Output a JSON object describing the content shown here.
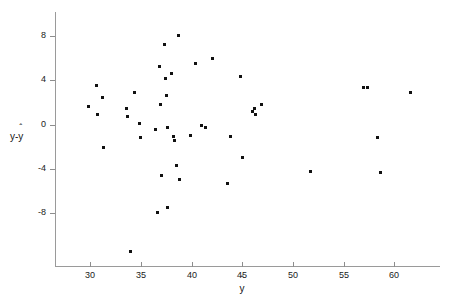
{
  "chart_data": {
    "type": "scatter",
    "title": "",
    "xlabel": "ŷ",
    "ylabel": "y-ŷ",
    "xlim": [
      26.5,
      64.5
    ],
    "ylim": [
      -12.8,
      10.2
    ],
    "grid": false,
    "legend": null,
    "xticks": [
      30,
      35,
      40,
      45,
      50,
      55,
      60
    ],
    "xticklabels": [
      "30",
      "35",
      "40",
      "45",
      "50",
      "55",
      "60"
    ],
    "yticks": [
      8,
      4,
      0,
      -4,
      -8
    ],
    "yticklabels": [
      "8",
      "4",
      "0",
      "-4",
      "-8"
    ],
    "marker": "square",
    "marker_color": "#111111",
    "axis_color": "#9a9a9a",
    "points": [
      {
        "x": 29.8,
        "y": 1.6
      },
      {
        "x": 30.6,
        "y": 3.5
      },
      {
        "x": 30.7,
        "y": 0.9
      },
      {
        "x": 31.2,
        "y": 2.5
      },
      {
        "x": 31.3,
        "y": -2.1
      },
      {
        "x": 33.6,
        "y": 1.5
      },
      {
        "x": 33.7,
        "y": 0.7
      },
      {
        "x": 34.0,
        "y": -11.5
      },
      {
        "x": 34.3,
        "y": 2.9
      },
      {
        "x": 34.8,
        "y": 0.1
      },
      {
        "x": 34.9,
        "y": -1.2
      },
      {
        "x": 36.4,
        "y": -0.4
      },
      {
        "x": 36.6,
        "y": -8.0
      },
      {
        "x": 36.8,
        "y": 5.3
      },
      {
        "x": 36.9,
        "y": 1.8
      },
      {
        "x": 37.0,
        "y": -4.6
      },
      {
        "x": 37.3,
        "y": 7.3
      },
      {
        "x": 37.4,
        "y": 4.2
      },
      {
        "x": 37.5,
        "y": 2.6
      },
      {
        "x": 37.6,
        "y": -0.3
      },
      {
        "x": 37.6,
        "y": -7.5
      },
      {
        "x": 38.0,
        "y": 4.6
      },
      {
        "x": 38.2,
        "y": -1.1
      },
      {
        "x": 38.3,
        "y": -1.4
      },
      {
        "x": 38.5,
        "y": -3.7
      },
      {
        "x": 38.7,
        "y": 8.1
      },
      {
        "x": 38.8,
        "y": -5.0
      },
      {
        "x": 39.9,
        "y": -1.0
      },
      {
        "x": 40.4,
        "y": 5.5
      },
      {
        "x": 41.0,
        "y": -0.1
      },
      {
        "x": 41.4,
        "y": -0.3
      },
      {
        "x": 42.0,
        "y": 6.0
      },
      {
        "x": 43.5,
        "y": -5.3
      },
      {
        "x": 43.8,
        "y": -1.1
      },
      {
        "x": 44.8,
        "y": 4.4
      },
      {
        "x": 45.0,
        "y": -3.0
      },
      {
        "x": 46.0,
        "y": 1.2
      },
      {
        "x": 46.2,
        "y": 1.5
      },
      {
        "x": 46.3,
        "y": 0.9
      },
      {
        "x": 46.9,
        "y": 1.8
      },
      {
        "x": 51.7,
        "y": -4.2
      },
      {
        "x": 56.9,
        "y": 3.4
      },
      {
        "x": 57.3,
        "y": 3.4
      },
      {
        "x": 58.3,
        "y": -1.2
      },
      {
        "x": 58.6,
        "y": -4.3
      },
      {
        "x": 61.6,
        "y": 2.9
      }
    ]
  }
}
